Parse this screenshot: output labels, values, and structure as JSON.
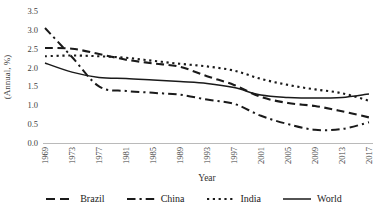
{
  "chart_data": {
    "type": "line",
    "title": "",
    "xlabel": "Year",
    "ylabel": "(Annual, %)",
    "ylim": [
      0,
      3.5
    ],
    "ytick_labels": [
      "0.0",
      "0.5",
      "1.0",
      "1.5",
      "2.0",
      "2.5",
      "3.0",
      "3.5"
    ],
    "categories": [
      1969,
      1973,
      1977,
      1981,
      1985,
      1989,
      1993,
      1997,
      2001,
      2005,
      2009,
      2013,
      2017
    ],
    "grid": false,
    "legend_position": "bottom",
    "axis_color": "#a8a8a8",
    "text_color": "#404040",
    "line_color": "#1a1a1a",
    "series": [
      {
        "name": "Brazil",
        "line_style": "dashed",
        "color": "#1a1a1a",
        "values": [
          2.52,
          2.5,
          2.36,
          2.21,
          2.11,
          2.02,
          1.77,
          1.54,
          1.22,
          1.06,
          0.98,
          0.84,
          0.68
        ]
      },
      {
        "name": "China",
        "line_style": "dashdot",
        "color": "#1a1a1a",
        "values": [
          3.05,
          2.28,
          1.5,
          1.38,
          1.33,
          1.28,
          1.15,
          1.04,
          0.72,
          0.5,
          0.35,
          0.37,
          0.55
        ]
      },
      {
        "name": "India",
        "line_style": "dotted",
        "color": "#1a1a1a",
        "values": [
          2.3,
          2.32,
          2.3,
          2.26,
          2.18,
          2.1,
          2.03,
          1.92,
          1.7,
          1.54,
          1.42,
          1.32,
          1.12
        ]
      },
      {
        "name": "World",
        "line_style": "solid",
        "color": "#1a1a1a",
        "values": [
          2.12,
          1.88,
          1.74,
          1.71,
          1.67,
          1.63,
          1.58,
          1.47,
          1.27,
          1.21,
          1.19,
          1.21,
          1.3
        ]
      }
    ]
  }
}
